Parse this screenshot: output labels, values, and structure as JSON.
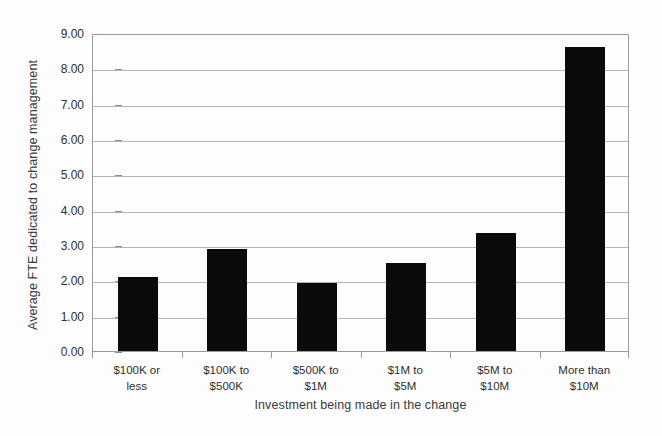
{
  "chart_data": {
    "type": "bar",
    "title": "",
    "categories": [
      "$100K or\nless",
      "$100K to\n$500K",
      "$500K to\n$1M",
      "$1M to\n$5M",
      "$5M to\n$10M",
      "More than\n$10M"
    ],
    "category_lines": [
      [
        "$100K or",
        "less"
      ],
      [
        "$100K to",
        "$500K"
      ],
      [
        "$500K to",
        "$1M"
      ],
      [
        "$1M to",
        "$5M"
      ],
      [
        "$5M to",
        "$10M"
      ],
      [
        "More than",
        "$10M"
      ]
    ],
    "values": [
      2.1,
      2.88,
      1.93,
      2.5,
      3.33,
      8.6
    ],
    "xlabel": "Investment being made in the change",
    "ylabel": "Average FTE dedicated to change management",
    "ylim": [
      0,
      9
    ],
    "ytick_step": 1,
    "ytick_labels": [
      "0.00",
      "1.00",
      "2.00",
      "3.00",
      "4.00",
      "5.00",
      "6.00",
      "7.00",
      "8.00",
      "9.00"
    ],
    "grid": true,
    "grid_axis": "y",
    "legend": null,
    "bar_color": "#0b0b0b",
    "grid_color": "#b4b4b4",
    "axis_color": "#9a9a9a",
    "background_color": "#fdfdfd"
  }
}
